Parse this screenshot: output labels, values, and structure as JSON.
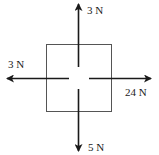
{
  "diagram": {
    "type": "free-body diagram",
    "object": "square block",
    "forces": [
      {
        "direction": "up",
        "label": "3 N"
      },
      {
        "direction": "left",
        "label": "3 N"
      },
      {
        "direction": "right",
        "label": "24 N"
      },
      {
        "direction": "down",
        "label": "5 N"
      }
    ],
    "colors": {
      "line": "#1a1a1a",
      "box": "#555555"
    }
  }
}
